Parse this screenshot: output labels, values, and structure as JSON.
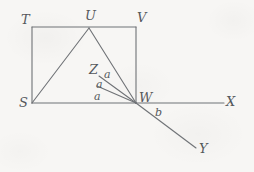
{
  "figure": {
    "canvas": {
      "width": 254,
      "height": 172
    },
    "stroke_color": "#6f7276",
    "background_color": "#f7f6f4",
    "label_color": "#55585c",
    "points": {
      "T": {
        "x": 32,
        "y": 27
      },
      "U": {
        "x": 89,
        "y": 28
      },
      "V": {
        "x": 136,
        "y": 27
      },
      "S": {
        "x": 32,
        "y": 103
      },
      "W": {
        "x": 136,
        "y": 103
      },
      "Z": {
        "x": 99,
        "y": 76
      },
      "X": {
        "x": 224,
        "y": 103
      },
      "Y": {
        "x": 196,
        "y": 148
      },
      "M": {
        "x": 97,
        "y": 86
      }
    },
    "segments": [
      {
        "name": "rect-top-TV",
        "from": "T",
        "to": "V"
      },
      {
        "name": "rect-left-TS",
        "from": "T",
        "to": "S"
      },
      {
        "name": "rect-right-VW",
        "from": "V",
        "to": "W"
      },
      {
        "name": "base-SW",
        "from": "S",
        "to": "W"
      },
      {
        "name": "side-SU",
        "from": "S",
        "to": "U"
      },
      {
        "name": "side-UW",
        "from": "U",
        "to": "W"
      },
      {
        "name": "ray-WZ",
        "from": "W",
        "to": "Z"
      },
      {
        "name": "ray-WM",
        "from": "W",
        "to": "M"
      },
      {
        "name": "ray-WX",
        "from": "W",
        "to": "X"
      },
      {
        "name": "ray-WY",
        "from": "W",
        "to": "Y"
      }
    ],
    "vertex_labels": [
      {
        "key": "T",
        "text": "T",
        "x": 21,
        "y": 13
      },
      {
        "key": "U",
        "text": "U",
        "x": 85,
        "y": 9
      },
      {
        "key": "V",
        "text": "V",
        "x": 137,
        "y": 11
      },
      {
        "key": "S",
        "text": "S",
        "x": 19,
        "y": 96
      },
      {
        "key": "W",
        "text": "W",
        "x": 139,
        "y": 91
      },
      {
        "key": "Z",
        "text": "Z",
        "x": 89,
        "y": 63
      },
      {
        "key": "X",
        "text": "X",
        "x": 226,
        "y": 95
      },
      {
        "key": "Y",
        "text": "Y",
        "x": 199,
        "y": 142
      }
    ],
    "angle_labels": [
      {
        "key": "a1",
        "text": "a",
        "x": 104,
        "y": 69
      },
      {
        "key": "a2",
        "text": "a",
        "x": 96,
        "y": 79
      },
      {
        "key": "a3",
        "text": "a",
        "x": 94,
        "y": 91
      },
      {
        "key": "b",
        "text": "b",
        "x": 155,
        "y": 107
      }
    ]
  }
}
